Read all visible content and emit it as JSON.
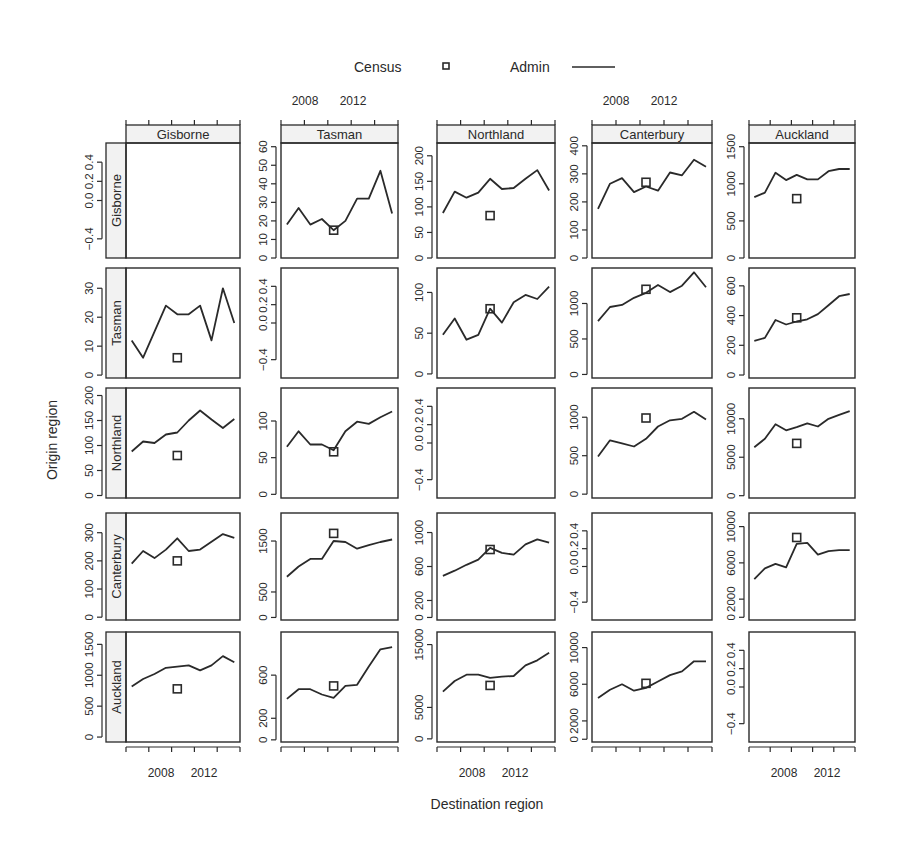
{
  "legend": {
    "census_label": "Census",
    "admin_label": "Admin"
  },
  "axes": {
    "xlabel": "Destination region",
    "ylabel": "Origin region"
  },
  "chart_data": {
    "type": "line",
    "title": "",
    "xlabel": "Destination region",
    "ylabel": "Origin region",
    "layout": "5x5 lattice; rows = origin region, columns = destination region; diagonal panels empty",
    "legend": [
      {
        "name": "Census",
        "marker": "open square"
      },
      {
        "name": "Admin",
        "marker": "line"
      }
    ],
    "legend_position": "top",
    "grid": false,
    "x": [
      2007,
      2008,
      2009,
      2010,
      2011,
      2012,
      2013,
      2014,
      2015,
      2016
    ],
    "x_ticks": [
      2008,
      2012
    ],
    "census_year": 2011,
    "regions": [
      "Gisborne",
      "Tasman",
      "Northland",
      "Canterbury",
      "Auckland"
    ],
    "panels": [
      {
        "origin": "Gisborne",
        "destination": "Gisborne",
        "empty": true,
        "yticks": [
          "-0.4",
          "0.0",
          "0.2",
          "0.4"
        ],
        "ylim": [
          -0.6,
          0.6
        ]
      },
      {
        "origin": "Gisborne",
        "destination": "Tasman",
        "yticks": [
          "0",
          "10",
          "20",
          "30",
          "40",
          "50",
          "60"
        ],
        "ylim": [
          0,
          62
        ],
        "admin": [
          18,
          27,
          18,
          21,
          15,
          20,
          32,
          32,
          47,
          24
        ],
        "census": 15
      },
      {
        "origin": "Gisborne",
        "destination": "Northland",
        "yticks": [
          "0",
          "50",
          "100",
          "150",
          "200"
        ],
        "ylim": [
          0,
          225
        ],
        "admin": [
          88,
          130,
          118,
          128,
          155,
          135,
          137,
          155,
          172,
          132
        ],
        "census": 83
      },
      {
        "origin": "Gisborne",
        "destination": "Canterbury",
        "yticks": [
          "0",
          "100",
          "200",
          "300",
          "400"
        ],
        "ylim": [
          0,
          410
        ],
        "admin": [
          175,
          265,
          285,
          235,
          255,
          240,
          305,
          295,
          350,
          325
        ],
        "census": 270
      },
      {
        "origin": "Gisborne",
        "destination": "Auckland",
        "yticks": [
          "0",
          "500",
          "1000",
          "1500"
        ],
        "ylim": [
          0,
          1550
        ],
        "admin": [
          820,
          880,
          1150,
          1050,
          1120,
          1060,
          1060,
          1170,
          1200,
          1200
        ],
        "census": 800
      },
      {
        "origin": "Tasman",
        "destination": "Gisborne",
        "yticks": [
          "0",
          "10",
          "20",
          "30"
        ],
        "ylim": [
          -1,
          37
        ],
        "admin": [
          12,
          6,
          15,
          24,
          21,
          21,
          24,
          12,
          30,
          18
        ],
        "census": 6
      },
      {
        "origin": "Tasman",
        "destination": "Tasman",
        "empty": true,
        "yticks": [
          "-0.4",
          "0.0",
          "0.2",
          "0.4"
        ],
        "ylim": [
          -0.6,
          0.6
        ]
      },
      {
        "origin": "Tasman",
        "destination": "Northland",
        "yticks": [
          "0",
          "50",
          "100"
        ],
        "ylim": [
          -5,
          130
        ],
        "admin": [
          48,
          68,
          42,
          48,
          80,
          63,
          88,
          97,
          92,
          107
        ],
        "census": 80
      },
      {
        "origin": "Tasman",
        "destination": "Canterbury",
        "yticks": [
          "0",
          "500",
          "1000"
        ],
        "ylim": [
          -50,
          1500
        ],
        "admin": [
          750,
          950,
          980,
          1080,
          1150,
          1260,
          1160,
          1250,
          1440,
          1230
        ],
        "census": 1200
      },
      {
        "origin": "Tasman",
        "destination": "Auckland",
        "yticks": [
          "0",
          "200",
          "400",
          "600"
        ],
        "ylim": [
          -20,
          720
        ],
        "admin": [
          230,
          250,
          370,
          340,
          360,
          375,
          410,
          470,
          530,
          545
        ],
        "census": 385
      },
      {
        "origin": "Northland",
        "destination": "Gisborne",
        "yticks": [
          "0",
          "50",
          "100",
          "150",
          "200"
        ],
        "ylim": [
          -5,
          215
        ],
        "admin": [
          88,
          108,
          105,
          122,
          126,
          150,
          170,
          152,
          135,
          153
        ],
        "census": 80
      },
      {
        "origin": "Northland",
        "destination": "Tasman",
        "yticks": [
          "0",
          "50",
          "100"
        ],
        "ylim": [
          -5,
          145
        ],
        "admin": [
          65,
          86,
          68,
          68,
          60,
          86,
          99,
          96,
          105,
          113
        ],
        "census": 58
      },
      {
        "origin": "Northland",
        "destination": "Northland",
        "empty": true,
        "yticks": [
          "-0.4",
          "0.0",
          "0.2",
          "0.4"
        ],
        "ylim": [
          -0.6,
          0.6
        ]
      },
      {
        "origin": "Northland",
        "destination": "Canterbury",
        "yticks": [
          "0",
          "500",
          "1000"
        ],
        "ylim": [
          -50,
          1380
        ],
        "admin": [
          490,
          700,
          660,
          620,
          720,
          880,
          960,
          980,
          1070,
          970
        ],
        "census": 990
      },
      {
        "origin": "Northland",
        "destination": "Auckland",
        "yticks": [
          "0",
          "5000",
          "10000"
        ],
        "ylim": [
          -300,
          14000
        ],
        "admin": [
          6300,
          7400,
          9300,
          8500,
          8900,
          9400,
          9000,
          10000,
          10500,
          11000
        ],
        "census": 6800
      },
      {
        "origin": "Canterbury",
        "destination": "Gisborne",
        "yticks": [
          "0",
          "100",
          "200",
          "300"
        ],
        "ylim": [
          -10,
          370
        ],
        "admin": [
          190,
          235,
          210,
          240,
          280,
          235,
          240,
          268,
          295,
          282
        ],
        "census": 200
      },
      {
        "origin": "Canterbury",
        "destination": "Tasman",
        "yticks": [
          "0",
          "500",
          "1500"
        ],
        "ylim": [
          -50,
          2050
        ],
        "admin": [
          800,
          1000,
          1150,
          1150,
          1500,
          1480,
          1350,
          1420,
          1480,
          1530
        ],
        "census": 1650
      },
      {
        "origin": "Canterbury",
        "destination": "Northland",
        "yticks": [
          "0",
          "200",
          "600",
          "1000"
        ],
        "ylim": [
          -30,
          1230
        ],
        "admin": [
          490,
          550,
          620,
          680,
          820,
          760,
          740,
          860,
          920,
          880
        ],
        "census": 800
      },
      {
        "origin": "Canterbury",
        "destination": "Canterbury",
        "empty": true,
        "yticks": [
          "-0.4",
          "0.0",
          "0.2",
          "0.4"
        ],
        "ylim": [
          -0.6,
          0.6
        ]
      },
      {
        "origin": "Canterbury",
        "destination": "Auckland",
        "yticks": [
          "0",
          "2000",
          "6000",
          "10000"
        ],
        "ylim": [
          -300,
          11500
        ],
        "admin": [
          4200,
          5400,
          5900,
          5500,
          8100,
          8200,
          6900,
          7300,
          7400,
          7400
        ],
        "census": 8800
      },
      {
        "origin": "Auckland",
        "destination": "Gisborne",
        "yticks": [
          "0",
          "500",
          "1000",
          "1500"
        ],
        "ylim": [
          -80,
          1700
        ],
        "admin": [
          820,
          940,
          1020,
          1120,
          1140,
          1160,
          1080,
          1160,
          1310,
          1210
        ],
        "census": 780
      },
      {
        "origin": "Auckland",
        "destination": "Tasman",
        "yticks": [
          "0",
          "200",
          "600"
        ],
        "ylim": [
          -20,
          1000
        ],
        "admin": [
          380,
          470,
          470,
          420,
          390,
          500,
          510,
          680,
          840,
          860
        ],
        "census": 500
      },
      {
        "origin": "Auckland",
        "destination": "Northland",
        "yticks": [
          "0",
          "5000",
          "15000"
        ],
        "ylim": [
          -500,
          17000
        ],
        "admin": [
          7500,
          9200,
          10200,
          10200,
          9700,
          9900,
          10000,
          11700,
          12500,
          13700
        ],
        "census": 8500
      },
      {
        "origin": "Auckland",
        "destination": "Canterbury",
        "yticks": [
          "0",
          "2000",
          "6000",
          "10000"
        ],
        "ylim": [
          -300,
          11700
        ],
        "admin": [
          4500,
          5400,
          6000,
          5300,
          5600,
          6300,
          7000,
          7400,
          8500,
          8500
        ],
        "census": 6100
      },
      {
        "origin": "Auckland",
        "destination": "Auckland",
        "empty": true,
        "yticks": [
          "-0.4",
          "0.0",
          "0.2",
          "0.4"
        ],
        "ylim": [
          -0.6,
          0.6
        ]
      }
    ]
  }
}
